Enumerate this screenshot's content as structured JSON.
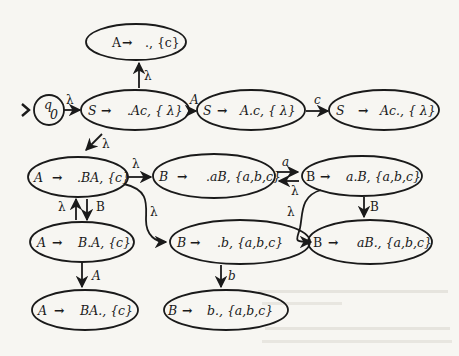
{
  "diagram": {
    "type": "LR item automaton",
    "start_state": {
      "id": "q0",
      "label": "q",
      "subscript": "0"
    },
    "colors": {
      "ink": "#1a1a1a",
      "paper": "#f7f6f2",
      "bleed": "#d9d7d0"
    },
    "nodes": [
      {
        "id": "n_a_empty",
        "lhs": "A",
        "rhs": "., {c}"
      },
      {
        "id": "n_s_start",
        "lhs": "S",
        "rhs": ".Ac, { λ}"
      },
      {
        "id": "n_s_mid",
        "lhs": "S",
        "rhs": "A.c, { λ}"
      },
      {
        "id": "n_s_end",
        "lhs": "S",
        "rhs": "Ac., { λ}"
      },
      {
        "id": "n_a_ba",
        "lhs": "A",
        "rhs": ".BA, {c}"
      },
      {
        "id": "n_b_ab",
        "lhs": "B",
        "rhs": ".aB, {a,b,c}"
      },
      {
        "id": "n_b_a_b",
        "lhs": "B",
        "rhs": "a.B, {a,b,c}"
      },
      {
        "id": "n_a_b_a",
        "lhs": "A",
        "rhs": "B.A, {c}"
      },
      {
        "id": "n_b_b",
        "lhs": "B",
        "rhs": ".b, {a,b,c}"
      },
      {
        "id": "n_b_ab_done",
        "lhs": "B",
        "rhs": "aB., {a,b,c}"
      },
      {
        "id": "n_a_ba_done",
        "lhs": "A",
        "rhs": "BA., {c}"
      },
      {
        "id": "n_b_b_done",
        "lhs": "B",
        "rhs": "b., {a,b,c}"
      }
    ],
    "arrow": "→",
    "edges": [
      {
        "from": "q0",
        "to": "n_s_start",
        "label": "λ"
      },
      {
        "from": "n_s_start",
        "to": "n_a_empty",
        "label": "λ"
      },
      {
        "from": "n_s_start",
        "to": "n_s_mid",
        "label": "A"
      },
      {
        "from": "n_s_mid",
        "to": "n_s_end",
        "label": "c"
      },
      {
        "from": "n_s_start",
        "to": "n_a_ba",
        "label": "λ"
      },
      {
        "from": "n_a_ba",
        "to": "n_b_ab",
        "label": "λ"
      },
      {
        "from": "n_a_ba",
        "to": "n_b_b",
        "label": "λ"
      },
      {
        "from": "n_b_ab",
        "to": "n_b_a_b",
        "label": "a"
      },
      {
        "from": "n_b_a_b",
        "to": "n_b_ab",
        "label": "λ"
      },
      {
        "from": "n_b_a_b",
        "to": "n_b_b",
        "label": "λ"
      },
      {
        "from": "n_b_a_b",
        "to": "n_b_ab_done",
        "label": "B"
      },
      {
        "from": "n_a_b_a",
        "to": "n_a_ba",
        "label": "λ"
      },
      {
        "from": "n_a_ba",
        "to": "n_a_b_a",
        "label": "B"
      },
      {
        "from": "n_a_b_a",
        "to": "n_a_ba_done",
        "label": "A"
      },
      {
        "from": "n_b_b",
        "to": "n_b_b_done",
        "label": "b"
      }
    ]
  }
}
